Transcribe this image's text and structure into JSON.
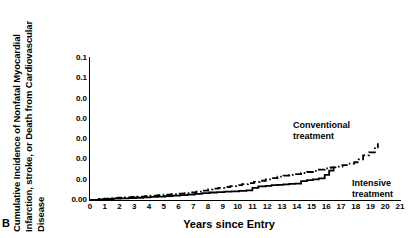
{
  "panel": {
    "letter": "B"
  },
  "axes": {
    "ytitle_line1": "Cumulative Incidence of Nonfatal Myocardial",
    "ytitle_line2": "Infarction, stroke, or Death from Cardiovascular",
    "ytitle_line3": "Disease",
    "xtitle": "Years since Entry"
  },
  "chart_data": {
    "type": "line",
    "title": "",
    "subtitle": "",
    "xlabel": "Years since Entry",
    "ylabel": "Cumulative Incidence of Nonfatal Myocardial Infarction, stroke, or Death from Cardiovascular Disease",
    "xlim": [
      0,
      21
    ],
    "ylim": [
      0.0,
      0.14
    ],
    "grid": false,
    "legend_position": "inline-annotation",
    "xticks": [
      0,
      1,
      2,
      3,
      4,
      5,
      6,
      7,
      8,
      9,
      10,
      11,
      12,
      13,
      14,
      15,
      16,
      17,
      18,
      19,
      20,
      21
    ],
    "xticklabels": [
      "0",
      "1",
      "2",
      "3",
      "4",
      "5",
      "6",
      "7",
      "8",
      "9",
      "10",
      "11",
      "12",
      "13",
      "14",
      "15",
      "16",
      "17",
      "18",
      "19",
      "20",
      "21"
    ],
    "yticks": [
      0.0,
      0.02,
      0.04,
      0.06,
      0.08,
      0.1,
      0.12,
      0.14
    ],
    "yticklabels": [
      "0.00",
      "0.0",
      "0.0",
      "0.0",
      "0.0",
      "0.0",
      "0.1",
      "0.1"
    ],
    "series": [
      {
        "name": "Conventional treatment",
        "style": "dash-dot",
        "color": "#000000",
        "annotation": "Conventional\ntreatment",
        "x": [
          0,
          0.6,
          1.0,
          1.4,
          1.9,
          2.3,
          2.8,
          3.2,
          3.7,
          4.1,
          4.6,
          5.0,
          5.5,
          5.9,
          6.4,
          6.8,
          7.2,
          7.6,
          8.0,
          8.3,
          8.7,
          9.1,
          9.5,
          9.9,
          10.3,
          10.7,
          11.1,
          11.5,
          11.9,
          12.3,
          12.7,
          13.1,
          13.5,
          13.9,
          14.3,
          14.7,
          15.1,
          15.5,
          15.9,
          16.3,
          16.7,
          17.1,
          17.5,
          17.9,
          18.2,
          18.5,
          18.9,
          19.3,
          19.5
        ],
        "y": [
          0.0,
          0.001,
          0.0014,
          0.0018,
          0.0022,
          0.0026,
          0.003,
          0.0034,
          0.0038,
          0.0042,
          0.0047,
          0.0052,
          0.0058,
          0.0063,
          0.0068,
          0.0074,
          0.0082,
          0.0092,
          0.0104,
          0.0112,
          0.012,
          0.0128,
          0.0137,
          0.0146,
          0.0156,
          0.0166,
          0.0178,
          0.019,
          0.0203,
          0.0216,
          0.023,
          0.024,
          0.0248,
          0.0256,
          0.0266,
          0.0276,
          0.0288,
          0.03,
          0.0312,
          0.0322,
          0.033,
          0.0344,
          0.0358,
          0.0372,
          0.04,
          0.044,
          0.047,
          0.052,
          0.056
        ]
      },
      {
        "name": "Intensive treatment",
        "style": "solid",
        "color": "#000000",
        "annotation": "Intensive\ntreatment",
        "x": [
          0,
          0.6,
          1.1,
          1.6,
          2.1,
          2.6,
          3.1,
          3.6,
          4.1,
          4.6,
          5.1,
          5.6,
          6.1,
          6.6,
          7.1,
          7.6,
          8.1,
          8.6,
          9.1,
          9.6,
          10.1,
          10.6,
          11.0,
          11.4,
          11.9,
          12.3,
          12.7,
          13.1,
          13.5,
          13.9,
          14.3,
          14.7,
          15.1,
          15.5,
          15.9,
          16.2,
          16.5
        ],
        "y": [
          0.0,
          0.0007,
          0.001,
          0.0013,
          0.0016,
          0.0019,
          0.0022,
          0.0026,
          0.003,
          0.0034,
          0.0038,
          0.0043,
          0.0048,
          0.0053,
          0.006,
          0.0068,
          0.0074,
          0.0078,
          0.0082,
          0.0086,
          0.009,
          0.0094,
          0.012,
          0.0134,
          0.014,
          0.0146,
          0.015,
          0.0154,
          0.0158,
          0.0162,
          0.0186,
          0.0196,
          0.0204,
          0.0214,
          0.0248,
          0.029,
          0.033
        ]
      }
    ]
  }
}
